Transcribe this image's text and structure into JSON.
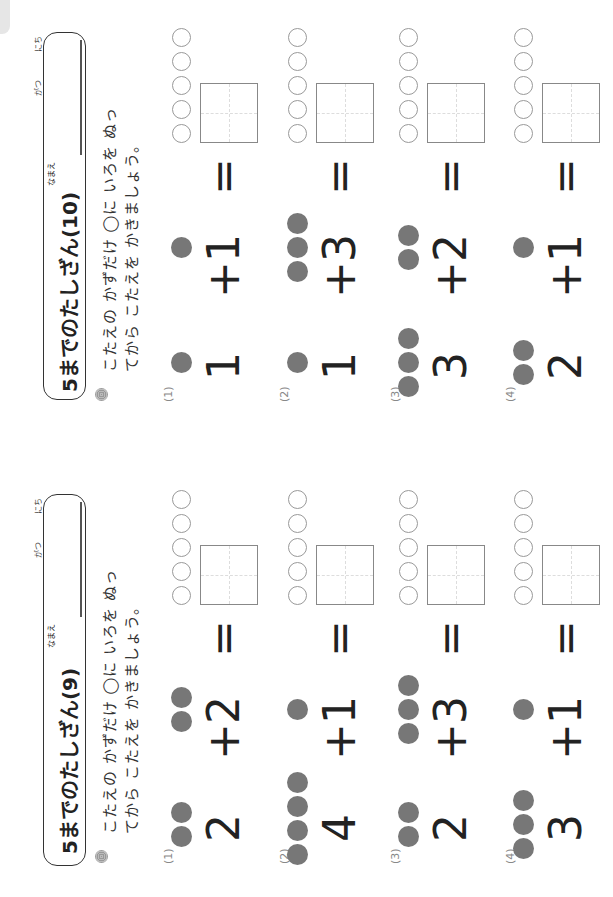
{
  "sheets": [
    {
      "title": "5までのたしざん(10)",
      "name_label": "なまえ",
      "month_label": "がつ",
      "day_label": "にち",
      "instruction_line1": "こたえの かずだけ ◯に いろを ぬっ",
      "instruction_line2": "てから こたえを かきましょう。",
      "problems": [
        {
          "label": "(1)",
          "a": "1",
          "b": "1",
          "op": "+",
          "eq": "="
        },
        {
          "label": "(2)",
          "a": "1",
          "b": "3",
          "op": "+",
          "eq": "="
        },
        {
          "label": "(3)",
          "a": "3",
          "b": "2",
          "op": "+",
          "eq": "="
        },
        {
          "label": "(4)",
          "a": "2",
          "b": "1",
          "op": "+",
          "eq": "="
        }
      ]
    },
    {
      "title": "5までのたしざん(9)",
      "name_label": "なまえ",
      "month_label": "がつ",
      "day_label": "にち",
      "instruction_line1": "こたえの かずだけ ◯に いろを ぬっ",
      "instruction_line2": "てから こたえを かきましょう。",
      "problems": [
        {
          "label": "(1)",
          "a": "2",
          "b": "2",
          "op": "+",
          "eq": "="
        },
        {
          "label": "(2)",
          "a": "4",
          "b": "1",
          "op": "+",
          "eq": "="
        },
        {
          "label": "(3)",
          "a": "2",
          "b": "3",
          "op": "+",
          "eq": "="
        },
        {
          "label": "(4)",
          "a": "3",
          "b": "1",
          "op": "+",
          "eq": "="
        }
      ]
    }
  ],
  "colors": {
    "dot": "#777777",
    "empty_circle": "#999999",
    "ink": "#222222"
  }
}
